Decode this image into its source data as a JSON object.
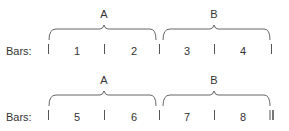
{
  "rows": [
    {
      "label": "Bars:",
      "sections": [
        {
          "name": "A"
        },
        {
          "name": "B"
        }
      ],
      "bars": [
        "1",
        "2",
        "3",
        "4"
      ],
      "final_barline": false
    },
    {
      "label": "Bars:",
      "sections": [
        {
          "name": "A"
        },
        {
          "name": "B"
        }
      ],
      "bars": [
        "5",
        "6",
        "7",
        "8"
      ],
      "final_barline": true
    }
  ],
  "colors": {
    "line": "#555555",
    "text": "#333333"
  }
}
